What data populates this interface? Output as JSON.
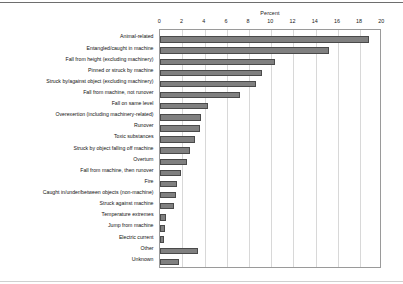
{
  "chart_data": {
    "type": "bar",
    "orientation": "horizontal",
    "title": "",
    "xlabel": "Percent",
    "ylabel": "",
    "xlim": [
      0,
      20
    ],
    "xticks": [
      0,
      2,
      4,
      6,
      8,
      10,
      12,
      14,
      16,
      18,
      20
    ],
    "xtick_labels": [
      "0",
      "2",
      "4",
      "6",
      "8",
      "10",
      "12",
      "14",
      "16",
      "18",
      "20"
    ],
    "grid": true,
    "grid_axis": "x",
    "legend": false,
    "bar_color": "#808080",
    "bar_edge_color": "#4a4a4a",
    "categories": [
      "Animal-related",
      "Entangled/caught in machine",
      "Fall from height (excluding machinery)",
      "Pinned or struck by machine",
      "Struck by/against object (excluding machinery)",
      "Fall from machine, not runover",
      "Fall on same level",
      "Overexertion (including machinery-related)",
      "Runover",
      "Toxic substances",
      "Struck by object falling off machine",
      "Overturn",
      "Fall from machine, then runover",
      "Fire",
      "Caught in/under/between objects (non-machine)",
      "Struck against machine",
      "Temperature extremes",
      "Jump from machine",
      "Electric current",
      "Other",
      "Unknown"
    ],
    "values": [
      18.8,
      15.2,
      10.3,
      9.2,
      8.6,
      7.2,
      4.3,
      3.7,
      3.6,
      3.1,
      2.7,
      2.4,
      1.9,
      1.5,
      1.4,
      1.2,
      0.5,
      0.4,
      0.3,
      3.4,
      1.7
    ]
  }
}
